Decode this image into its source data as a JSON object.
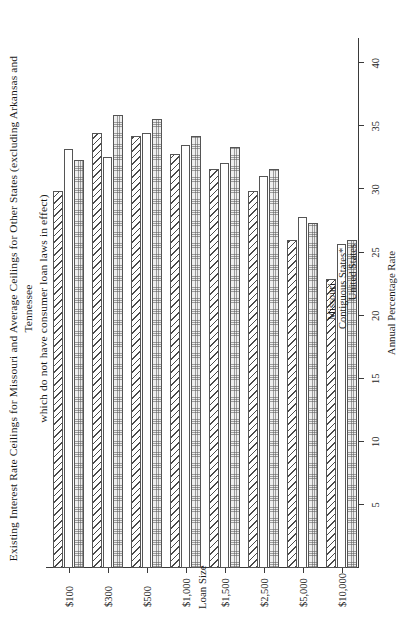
{
  "chart_data": {
    "type": "bar",
    "orientation": "horizontal",
    "title": "Existing Interest Rate Ceilings for Missouri and Average Ceilings for Other States (excluding Arkansas and Tennessee which do not have consumer loan laws in effect)",
    "title_line1": "Existing Interest Rate Ceilings for Missouri and Average Ceilings for Other States (excluding Arkansas and Tennessee",
    "title_line2": "which do not have consumer loan laws in effect)",
    "xlabel": "Loan Size",
    "ylabel": "Annual Percentage Rate",
    "categories": [
      "$100",
      "$300",
      "$500",
      "$1,000",
      "$1,500",
      "$2,500",
      "$5,000",
      "$10,000"
    ],
    "ylim": [
      0,
      42
    ],
    "yticks": [
      5,
      10,
      15,
      20,
      25,
      30,
      35,
      40
    ],
    "ytick_labels": [
      "5",
      "10",
      "15",
      "20",
      "25",
      "30",
      "35",
      "40"
    ],
    "grid": false,
    "legend_position": "top-right",
    "series": [
      {
        "name": "Missouri",
        "fill": "diagonal-hatch",
        "values": [
          29.9,
          34.5,
          34.2,
          32.8,
          31.6,
          29.9,
          26.0,
          22.9
        ]
      },
      {
        "name": "Contiguous States*",
        "fill": "white",
        "values": [
          33.2,
          32.6,
          34.5,
          33.5,
          32.1,
          31.1,
          27.8,
          25.7
        ]
      },
      {
        "name": "United States",
        "fill": "dotted",
        "values": [
          32.3,
          35.9,
          35.6,
          34.2,
          33.4,
          31.6,
          27.3,
          26.0
        ]
      }
    ]
  },
  "legend": {
    "items": [
      {
        "label": "Missouri"
      },
      {
        "label": "Contiguous States*"
      },
      {
        "label": "United States"
      }
    ]
  }
}
